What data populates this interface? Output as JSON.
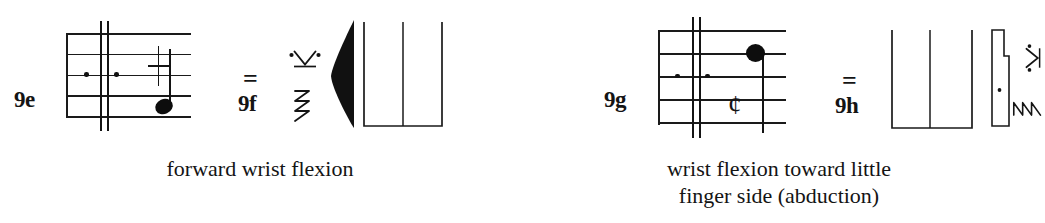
{
  "figure": {
    "type": "benesh-movement-notation-plate",
    "ink_color": "#1a1a1a",
    "background_color": "#ffffff"
  },
  "examples": [
    {
      "staff_label": "9e",
      "figure_label": "9f",
      "equals": "=",
      "caption_lines": [
        "forward wrist flexion"
      ],
      "staff": {
        "lines": 5,
        "barlines": 2,
        "level_dots": 2,
        "cross_sign": "plus",
        "notehead": "filled-oval",
        "notehead_position": "below-fourth-line",
        "stem": "up"
      },
      "side_glyphs": [
        "dotted-v-icon",
        "reversed-e-icon",
        "black-leaf-icon",
        "u-bracket-icon"
      ]
    },
    {
      "staff_label": "9g",
      "figure_label": "9h",
      "equals": "=",
      "caption_lines": [
        "wrist flexion toward little",
        "finger side (abduction)"
      ],
      "staff": {
        "lines": 5,
        "barlines": 2,
        "level_dots": 2,
        "cross_sign": "cent",
        "cent_symbol": "¢",
        "notehead": "filled-circle",
        "notehead_position": "on-second-line",
        "stem": "down"
      },
      "side_glyphs": [
        "u-bracket-icon",
        "stepped-bar-icon",
        "dotted-v-icon-rotated",
        "reversed-e-icon-rotated"
      ]
    }
  ]
}
